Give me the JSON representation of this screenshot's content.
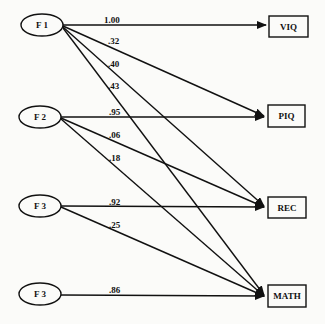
{
  "diagram": {
    "type": "path-diagram",
    "latent_factors": [
      {
        "id": "f1",
        "label": "F 1",
        "cx": 42,
        "cy": 25
      },
      {
        "id": "f2",
        "label": "F 2",
        "cx": 40,
        "cy": 117
      },
      {
        "id": "f3a",
        "label": "F 3",
        "cx": 40,
        "cy": 206
      },
      {
        "id": "f3b",
        "label": "F 3",
        "cx": 40,
        "cy": 294
      }
    ],
    "observed_variables": [
      {
        "id": "viq",
        "label": "VIQ",
        "x": 269,
        "y": 16
      },
      {
        "id": "piq",
        "label": "PIQ",
        "x": 268,
        "y": 105
      },
      {
        "id": "rec",
        "label": "REC",
        "x": 268,
        "y": 197
      },
      {
        "id": "math",
        "label": "MATH",
        "x": 268,
        "y": 285
      }
    ],
    "paths": [
      {
        "from": "f1",
        "to": "viq",
        "coefficient": "1.00"
      },
      {
        "from": "f1",
        "to": "piq",
        "coefficient": ".32"
      },
      {
        "from": "f1",
        "to": "rec",
        "coefficient": ".40"
      },
      {
        "from": "f1",
        "to": "math",
        "coefficient": ".43"
      },
      {
        "from": "f2",
        "to": "piq",
        "coefficient": ".95"
      },
      {
        "from": "f2",
        "to": "rec",
        "coefficient": ".06"
      },
      {
        "from": "f2",
        "to": "math",
        "coefficient": ".18"
      },
      {
        "from": "f3a",
        "to": "rec",
        "coefficient": ".92"
      },
      {
        "from": "f3a",
        "to": "math",
        "coefficient": ".25"
      },
      {
        "from": "f3b",
        "to": "math",
        "coefficient": ".86"
      }
    ]
  }
}
